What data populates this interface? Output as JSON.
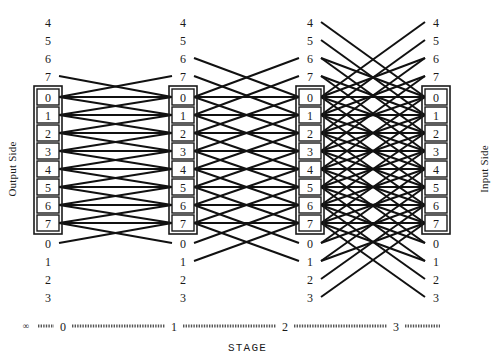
{
  "figure": {
    "caption": "STAGE",
    "left_side_label": "Output Side",
    "right_side_label": "Input Side",
    "infinity_marker": "∞"
  },
  "colors": {
    "line": "#111111",
    "box_stroke": "#1a1a1a",
    "box_fill": "#ffffff",
    "text": "#1a1a1a",
    "axis": "#555555",
    "background": "#ffffff"
  },
  "stage_axis": {
    "ticks": [
      "0",
      "1",
      "2",
      "3"
    ],
    "tick_x": [
      63,
      174,
      285,
      396
    ],
    "y": 326
  },
  "columns": [
    {
      "stage": "0",
      "x": 48,
      "top_labels": [
        "4",
        "5",
        "6",
        "7"
      ],
      "boxes": [
        "0",
        "1",
        "2",
        "3",
        "4",
        "5",
        "6",
        "7"
      ],
      "bottom_labels": [
        "0",
        "1",
        "2",
        "3"
      ]
    },
    {
      "stage": "1",
      "x": 183,
      "top_labels": [
        "4",
        "5",
        "6",
        "7"
      ],
      "boxes": [
        "0",
        "1",
        "2",
        "3",
        "4",
        "5",
        "6",
        "7"
      ],
      "bottom_labels": [
        "0",
        "1",
        "2",
        "3"
      ]
    },
    {
      "stage": "2",
      "x": 310,
      "top_labels": [
        "4",
        "5",
        "6",
        "7"
      ],
      "boxes": [
        "0",
        "1",
        "2",
        "3",
        "4",
        "5",
        "6",
        "7"
      ],
      "bottom_labels": [
        "0",
        "1",
        "2",
        "3"
      ]
    },
    {
      "stage": "3",
      "x": 436,
      "top_labels": [
        "4",
        "5",
        "6",
        "7"
      ],
      "boxes": [
        "0",
        "1",
        "2",
        "3",
        "4",
        "5",
        "6",
        "7"
      ],
      "bottom_labels": [
        "0",
        "1",
        "2",
        "3"
      ]
    }
  ],
  "chart_data": {
    "type": "diagram",
    "title": "STAGE",
    "node_rows": {
      "phantom_top": [
        "4",
        "5",
        "6",
        "7"
      ],
      "boxed": [
        "0",
        "1",
        "2",
        "3",
        "4",
        "5",
        "6",
        "7"
      ],
      "phantom_bottom": [
        "0",
        "1",
        "2",
        "3"
      ]
    },
    "row_y": [
      22,
      40,
      58,
      76,
      97,
      115,
      133,
      151,
      169,
      187,
      205,
      223,
      243,
      261,
      279,
      297
    ],
    "column_x": [
      62,
      172,
      196,
      298,
      322,
      424
    ],
    "link_spans": [
      1,
      2,
      4
    ],
    "links": [
      {
        "from_stage": "0",
        "to_stage": "1",
        "span_rows": 1,
        "pairs": [
          [
            3,
            4
          ],
          [
            4,
            3
          ],
          [
            4,
            5
          ],
          [
            5,
            4
          ],
          [
            5,
            6
          ],
          [
            6,
            5
          ],
          [
            6,
            7
          ],
          [
            7,
            6
          ],
          [
            7,
            8
          ],
          [
            8,
            7
          ],
          [
            8,
            9
          ],
          [
            9,
            8
          ],
          [
            9,
            10
          ],
          [
            10,
            9
          ],
          [
            10,
            11
          ],
          [
            11,
            10
          ],
          [
            11,
            12
          ],
          [
            12,
            11
          ],
          [
            4,
            4
          ],
          [
            5,
            5
          ],
          [
            6,
            6
          ],
          [
            7,
            7
          ],
          [
            8,
            8
          ],
          [
            9,
            9
          ],
          [
            10,
            10
          ],
          [
            11,
            11
          ]
        ]
      },
      {
        "from_stage": "1",
        "to_stage": "2",
        "span_rows": 2,
        "pairs": [
          [
            2,
            4
          ],
          [
            4,
            2
          ],
          [
            3,
            5
          ],
          [
            5,
            3
          ],
          [
            4,
            6
          ],
          [
            6,
            4
          ],
          [
            5,
            7
          ],
          [
            7,
            5
          ],
          [
            6,
            8
          ],
          [
            8,
            6
          ],
          [
            7,
            9
          ],
          [
            9,
            7
          ],
          [
            8,
            10
          ],
          [
            10,
            8
          ],
          [
            9,
            11
          ],
          [
            11,
            9
          ],
          [
            10,
            12
          ],
          [
            12,
            10
          ],
          [
            11,
            13
          ],
          [
            13,
            11
          ],
          [
            4,
            4
          ],
          [
            5,
            5
          ],
          [
            6,
            6
          ],
          [
            7,
            7
          ],
          [
            8,
            8
          ],
          [
            9,
            9
          ],
          [
            10,
            10
          ],
          [
            11,
            11
          ]
        ]
      },
      {
        "from_stage": "2",
        "to_stage": "3",
        "span_rows": 4,
        "pairs": [
          [
            0,
            4
          ],
          [
            4,
            0
          ],
          [
            1,
            5
          ],
          [
            5,
            1
          ],
          [
            2,
            6
          ],
          [
            6,
            2
          ],
          [
            3,
            7
          ],
          [
            7,
            3
          ],
          [
            4,
            8
          ],
          [
            8,
            4
          ],
          [
            5,
            9
          ],
          [
            9,
            5
          ],
          [
            6,
            10
          ],
          [
            10,
            6
          ],
          [
            7,
            11
          ],
          [
            11,
            7
          ],
          [
            8,
            12
          ],
          [
            12,
            8
          ],
          [
            9,
            13
          ],
          [
            13,
            9
          ],
          [
            10,
            14
          ],
          [
            14,
            10
          ],
          [
            11,
            15
          ],
          [
            15,
            11
          ],
          [
            4,
            4
          ],
          [
            5,
            5
          ],
          [
            6,
            6
          ],
          [
            7,
            7
          ],
          [
            8,
            8
          ],
          [
            9,
            9
          ],
          [
            10,
            10
          ],
          [
            11,
            11
          ],
          [
            2,
            4
          ],
          [
            4,
            2
          ],
          [
            3,
            5
          ],
          [
            5,
            3
          ],
          [
            6,
            8
          ],
          [
            8,
            6
          ],
          [
            7,
            9
          ],
          [
            9,
            7
          ],
          [
            10,
            12
          ],
          [
            12,
            10
          ],
          [
            11,
            13
          ],
          [
            13,
            11
          ],
          [
            4,
            6
          ],
          [
            6,
            4
          ],
          [
            5,
            7
          ],
          [
            7,
            5
          ],
          [
            8,
            10
          ],
          [
            10,
            8
          ],
          [
            9,
            11
          ],
          [
            11,
            9
          ]
        ]
      }
    ]
  }
}
